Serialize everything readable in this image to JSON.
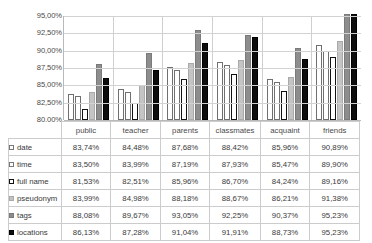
{
  "chart_data": {
    "type": "bar",
    "title": "",
    "xlabel": "",
    "ylabel": "",
    "ylim": [
      80.0,
      95.0
    ],
    "ytick_labels": [
      "95,00%",
      "92,50%",
      "90,00%",
      "87,50%",
      "85,00%",
      "82,50%",
      "80,00%"
    ],
    "ytick_values": [
      95.0,
      92.5,
      90.0,
      87.5,
      85.0,
      82.5,
      80.0
    ],
    "grid": true,
    "legend_position": "table-row-labels",
    "categories": [
      "public",
      "teacher",
      "parents",
      "classmates",
      "acquaint",
      "friends"
    ],
    "series": [
      {
        "name": "date",
        "marker": "white-square",
        "values": [
          83.74,
          84.48,
          87.68,
          88.42,
          85.96,
          90.89
        ],
        "labels": [
          "83,74%",
          "84,48%",
          "87,68%",
          "88,42%",
          "85,96%",
          "90,89%"
        ]
      },
      {
        "name": "time",
        "marker": "white-square",
        "values": [
          83.5,
          83.99,
          87.19,
          87.93,
          85.47,
          89.9
        ],
        "labels": [
          "83,50%",
          "83,99%",
          "87,19%",
          "87,93%",
          "85,47%",
          "89,90%"
        ]
      },
      {
        "name": "full name",
        "marker": "white-bold-square",
        "values": [
          81.53,
          82.51,
          85.96,
          86.7,
          84.24,
          89.16
        ],
        "labels": [
          "81,53%",
          "82,51%",
          "85,96%",
          "86,70%",
          "84,24%",
          "89,16%"
        ]
      },
      {
        "name": "pseudonym",
        "marker": "light-gray-square",
        "values": [
          83.99,
          84.98,
          88.18,
          88.67,
          86.21,
          91.38
        ],
        "labels": [
          "83,99%",
          "84,98%",
          "88,18%",
          "88,67%",
          "86,21%",
          "91,38%"
        ]
      },
      {
        "name": "tags",
        "marker": "medium-gray-square",
        "values": [
          88.08,
          89.67,
          93.05,
          92.25,
          90.37,
          95.23
        ],
        "labels": [
          "88,08%",
          "89,67%",
          "93,05%",
          "92,25%",
          "90,37%",
          "95,23%"
        ]
      },
      {
        "name": "locations",
        "marker": "black-square",
        "values": [
          86.13,
          87.28,
          91.04,
          91.91,
          88.73,
          95.23
        ],
        "labels": [
          "86,13%",
          "87,28%",
          "91,04%",
          "91,91%",
          "88,73%",
          "95,23%"
        ]
      }
    ],
    "colors": {
      "date": "#ffffff",
      "time": "#ffffff",
      "full_name": "#ffffff",
      "pseudonym": "#c4c4c4",
      "tags": "#8d8d8d",
      "locations": "#0d0d0d",
      "gridline": "#d2d2d2",
      "axis": "#b9b9b9",
      "text": "#3a3a3a"
    }
  },
  "table": {
    "column_headers": [
      "public",
      "teacher",
      "parents",
      "classmates",
      "acquaint",
      "friends"
    ],
    "rows": [
      {
        "label": "date",
        "values": [
          "83,74%",
          "84,48%",
          "87,68%",
          "88,42%",
          "85,96%",
          "90,89%"
        ]
      },
      {
        "label": "time",
        "values": [
          "83,50%",
          "83,99%",
          "87,19%",
          "87,93%",
          "85,47%",
          "89,90%"
        ]
      },
      {
        "label": "full name",
        "values": [
          "81,53%",
          "82,51%",
          "85,96%",
          "86,70%",
          "84,24%",
          "89,16%"
        ]
      },
      {
        "label": "pseudonym",
        "values": [
          "83,99%",
          "84,98%",
          "88,18%",
          "88,67%",
          "86,21%",
          "91,38%"
        ]
      },
      {
        "label": "tags",
        "values": [
          "88,08%",
          "89,67%",
          "93,05%",
          "92,25%",
          "90,37%",
          "95,23%"
        ]
      },
      {
        "label": "locations",
        "values": [
          "86,13%",
          "87,28%",
          "91,04%",
          "91,91%",
          "88,73%",
          "95,23%"
        ]
      }
    ]
  }
}
